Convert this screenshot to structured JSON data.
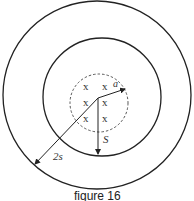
{
  "figure": {
    "caption": "figure 16",
    "labels": {
      "inner_radius": "a",
      "middle_radius": "S",
      "outer_radius": "2s"
    },
    "field_markers": [
      "x",
      "x",
      "x",
      "x",
      "x",
      "x"
    ],
    "colors": {
      "stroke": "#222222",
      "background": "#ffffff"
    }
  }
}
